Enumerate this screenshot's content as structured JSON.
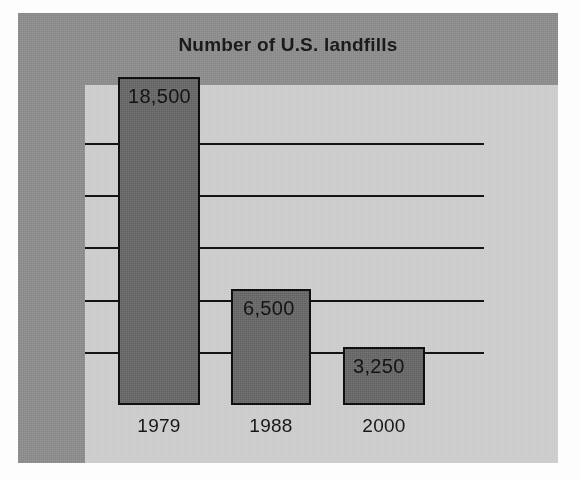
{
  "chart_data": {
    "type": "bar",
    "title": "Number of U.S. landfills",
    "xlabel": "",
    "ylabel": "",
    "categories": [
      "1979",
      "1988",
      "2000"
    ],
    "values": [
      18500,
      6500,
      3250
    ],
    "value_labels": [
      "18,500",
      "6,500",
      "3,250"
    ],
    "ylim": [
      0,
      20000
    ],
    "gridlines": [
      5000,
      8000,
      11000,
      14000,
      17000
    ],
    "grid": true,
    "legend": false,
    "legend_position": "none",
    "series": [
      {
        "name": "Number of U.S. landfills",
        "values": [
          18500,
          6500,
          3250
        ]
      }
    ],
    "colors": {
      "bar_fill": "#6b6b6b",
      "bar_outline": "#101010",
      "plot_background": "#cdcdcd",
      "panel_background": "#8e8e8e",
      "gridline": "#141414",
      "text": "#141414"
    }
  },
  "bars": [
    {
      "category": "1979",
      "value_label": "18,500",
      "left": 100,
      "top": 64,
      "width": 82,
      "height": 328,
      "label_left": 110,
      "label_top": 72,
      "cat_left": 75,
      "cat_top": 402,
      "cat_width": 132
    },
    {
      "category": "1988",
      "value_label": "6,500",
      "left": 213,
      "top": 276,
      "width": 80,
      "height": 116,
      "label_left": 225,
      "label_top": 284,
      "cat_left": 187,
      "cat_top": 402,
      "cat_width": 132
    },
    {
      "category": "2000",
      "value_label": "3,250",
      "left": 325,
      "top": 334,
      "width": 82,
      "height": 58,
      "label_left": 335,
      "label_top": 342,
      "cat_left": 300,
      "cat_top": 402,
      "cat_width": 132
    }
  ],
  "gridlines": [
    {
      "value": 17000,
      "top": 130,
      "left": 67,
      "width": 399
    },
    {
      "value": 14000,
      "top": 182,
      "left": 67,
      "width": 399
    },
    {
      "value": 11000,
      "top": 234,
      "left": 67,
      "width": 399
    },
    {
      "value": 8000,
      "top": 287,
      "left": 67,
      "width": 399
    },
    {
      "value": 5000,
      "top": 339,
      "left": 67,
      "width": 399
    }
  ],
  "axis_ticks": [
    {
      "top": 130,
      "left": 67,
      "width": 20
    },
    {
      "top": 182,
      "left": 67,
      "width": 20
    },
    {
      "top": 234,
      "left": 67,
      "width": 20
    },
    {
      "top": 287,
      "left": 67,
      "width": 20
    },
    {
      "top": 339,
      "left": 67,
      "width": 20
    }
  ]
}
